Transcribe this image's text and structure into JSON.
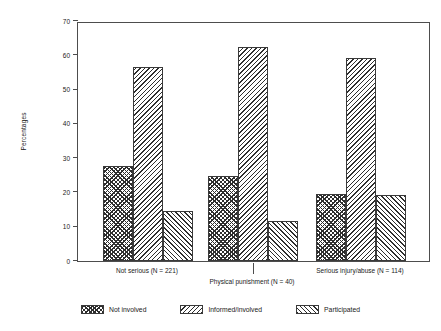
{
  "chart_data": {
    "type": "bar",
    "title": "",
    "subtitle": "",
    "xlabel": "",
    "ylabel": "Percentages",
    "ylim": [
      0,
      70
    ],
    "yticks": [
      0,
      10,
      20,
      30,
      40,
      50,
      60,
      70
    ],
    "ytick_labels": [
      "0",
      "10",
      "20",
      "30",
      "40",
      "50",
      "60",
      "70"
    ],
    "grid": false,
    "legend_position": "bottom-center",
    "categories": [
      "Not serious (N = 221)",
      "Physical punishment (N = 40)",
      "Serious injury/abuse (N = 114)"
    ],
    "series": [
      {
        "name": "Not involved",
        "pattern": "checkerboard",
        "values": [
          27.8,
          24.7,
          19.5
        ]
      },
      {
        "name": "Informed/involved",
        "pattern": "back-hatch",
        "values": [
          56.7,
          62.4,
          59.3
        ]
      },
      {
        "name": "Participated",
        "pattern": "forward-hatch",
        "values": [
          14.6,
          11.6,
          19.4
        ]
      }
    ],
    "colors": {
      "ink": "#2e2e2e",
      "axis": "#4d4d4d",
      "background": "#ffffff",
      "bar_edge": "#3a3a3a"
    }
  },
  "legend": {
    "items": [
      {
        "label": "Not involved"
      },
      {
        "label": "Informed/involved"
      },
      {
        "label": "Participated"
      }
    ]
  }
}
